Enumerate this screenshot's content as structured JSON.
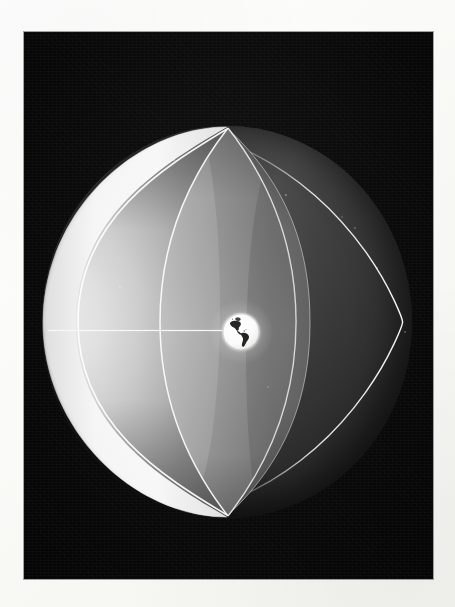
{
  "page": {
    "kind": "photographic-print",
    "border_color": "#fdfdfb",
    "width_px": 455,
    "height_px": 607
  },
  "photo": {
    "left_px": 24,
    "top_px": 32,
    "width_px": 409,
    "height_px": 547,
    "background_color": "#0a0a0a",
    "palette": {
      "space_black": "#0a0a0a",
      "shell_dark_grey": "#2b2b2b",
      "shell_mid_grey": "#5a5a5a",
      "inner_surface_light": "#d8d8d8",
      "rim_highlight": "#f2f2f2",
      "earth_white": "#ffffff",
      "continent_dark": "#2a2a2a",
      "line_white": "#f8f8f8"
    }
  },
  "scene": {
    "subject": "cutaway sphere model with tiny Earth at center",
    "lighting": "lit from upper left, terminator on right limb",
    "elements": [
      {
        "name": "outer-sphere-shell",
        "role": "large sphere shown in cutaway"
      },
      {
        "name": "cutaway-bowl",
        "role": "hollow interior revealed on the left"
      },
      {
        "name": "lens-wedge-segment",
        "role": "standing orange-peel wedge through the polar axis"
      },
      {
        "name": "central-earth-globe",
        "role": "tiny Earth at the sphere's center showing the Americas"
      },
      {
        "name": "equatorial-radius-line",
        "role": "thin white line from inner rim to the central Earth"
      }
    ]
  },
  "sphere": {
    "center_x_px": 203,
    "center_y_px": 290,
    "radius_x_px": 185,
    "radius_y_px": 196,
    "north_pole_y_px": 82,
    "south_pole_y_px": 474,
    "left_limb_x_px": 18,
    "right_limb_x_px": 388
  },
  "earth": {
    "center_x_px": 217,
    "center_y_px": 300,
    "diameter_px": 38,
    "visible_hemisphere": "Americas",
    "landmasses": [
      "North America",
      "South America",
      "Greenland"
    ]
  },
  "radius_line": {
    "from_x_px": 24,
    "to_x_px": 202,
    "y_px": 298,
    "color": "#f8f8f8"
  },
  "specks": [
    {
      "x": 318,
      "y": 185,
      "r": 1.2
    },
    {
      "x": 331,
      "y": 196,
      "r": 1.0
    },
    {
      "x": 353,
      "y": 236,
      "r": 0.9
    },
    {
      "x": 110,
      "y": 420,
      "r": 0.9
    },
    {
      "x": 96,
      "y": 255,
      "r": 0.8
    },
    {
      "x": 262,
      "y": 163,
      "r": 0.8
    },
    {
      "x": 244,
      "y": 355,
      "r": 0.9
    },
    {
      "x": 381,
      "y": 300,
      "r": 0.8
    },
    {
      "x": 150,
      "y": 128,
      "r": 0.8
    }
  ]
}
